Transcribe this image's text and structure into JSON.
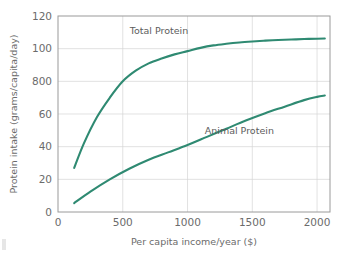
{
  "figure": {
    "background_color": "#ffffff",
    "accent_color": "#2f8a72",
    "grid_color": "#d6d6d6",
    "frame_color": "#9a9a9a",
    "text_color": "#6b6b6b"
  },
  "chart_data": {
    "type": "line",
    "title": "",
    "subtitle": "",
    "xlabel": "Per capita income/year ($)",
    "ylabel": "Protein intake (grams/capita/day)",
    "xlim": [
      0,
      2100
    ],
    "ylim": [
      0,
      120
    ],
    "xticks": [
      0,
      500,
      1000,
      1500,
      2000
    ],
    "xticklabels": [
      "0",
      "500",
      "1000",
      "1500",
      "2000"
    ],
    "yticks": [
      0,
      20,
      40,
      60,
      80,
      100,
      120
    ],
    "yticklabels": [
      "0",
      "20",
      "40",
      "60",
      "800",
      "100",
      "120"
    ],
    "grid": true,
    "grid_axis": "y",
    "legend": "none",
    "annotations": [
      {
        "text": "Total Protein",
        "x": 780,
        "y": 109
      },
      {
        "text": "Animal Protein",
        "x": 1400,
        "y": 48
      }
    ],
    "series": [
      {
        "name": "Total Protein",
        "color": "#2f8a72",
        "x": [
          125,
          200,
          300,
          400,
          500,
          600,
          700,
          800,
          900,
          1000,
          1100,
          1200,
          1300,
          1400,
          1500,
          1600,
          1700,
          1800,
          1900,
          2000,
          2060
        ],
        "y": [
          27,
          42,
          58,
          70,
          80,
          86.5,
          91,
          94,
          96.5,
          98.5,
          100.5,
          102,
          103,
          103.8,
          104.4,
          104.9,
          105.3,
          105.6,
          105.9,
          106.1,
          106.2
        ]
      },
      {
        "name": "Animal Protein",
        "color": "#2f8a72",
        "x": [
          125,
          250,
          400,
          550,
          700,
          850,
          1000,
          1150,
          1300,
          1450,
          1600,
          1750,
          1900,
          2000,
          2060
        ],
        "y": [
          5.5,
          12.5,
          20,
          26.5,
          32,
          36.5,
          41,
          46,
          51,
          56,
          60.5,
          64.5,
          68.5,
          70.5,
          71.3
        ]
      }
    ]
  }
}
